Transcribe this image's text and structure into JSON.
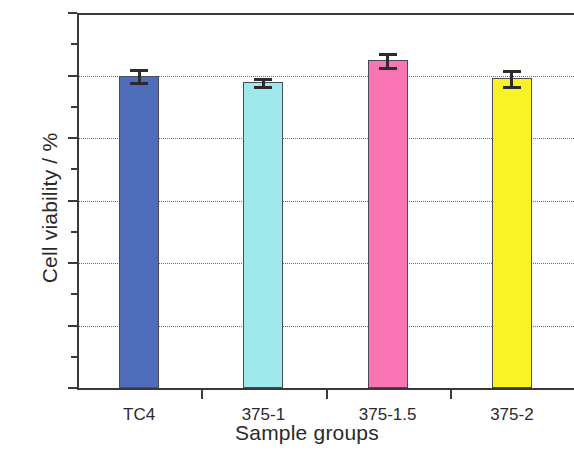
{
  "chart_data": {
    "type": "bar",
    "title": "",
    "xlabel": "Sample groups",
    "ylabel": "Cell viability / %",
    "categories": [
      "TC4",
      "375-1",
      "375-1.5",
      "375-2"
    ],
    "values": [
      100,
      97.8,
      105,
      99.2
    ],
    "errors": [
      2.0,
      1.3,
      2.3,
      2.5
    ],
    "bar_colors": [
      "#4f6dba",
      "#9fe8ec",
      "#f975b4",
      "#f9f326"
    ],
    "ylim": [
      0,
      120
    ],
    "yticks": [
      0,
      20,
      40,
      60,
      80,
      100,
      120
    ],
    "ytick_labels": [
      "0",
      "20",
      "40",
      "60",
      "80",
      "100",
      "120"
    ],
    "yminor_ticks": [
      10,
      30,
      50,
      70,
      90,
      110
    ],
    "grid": "horizontal-dotted",
    "legend": "none",
    "axis_color": "#3a3a3a",
    "grid_color": "#6b6b6b",
    "error_bar_color": "#2b2b2b"
  }
}
